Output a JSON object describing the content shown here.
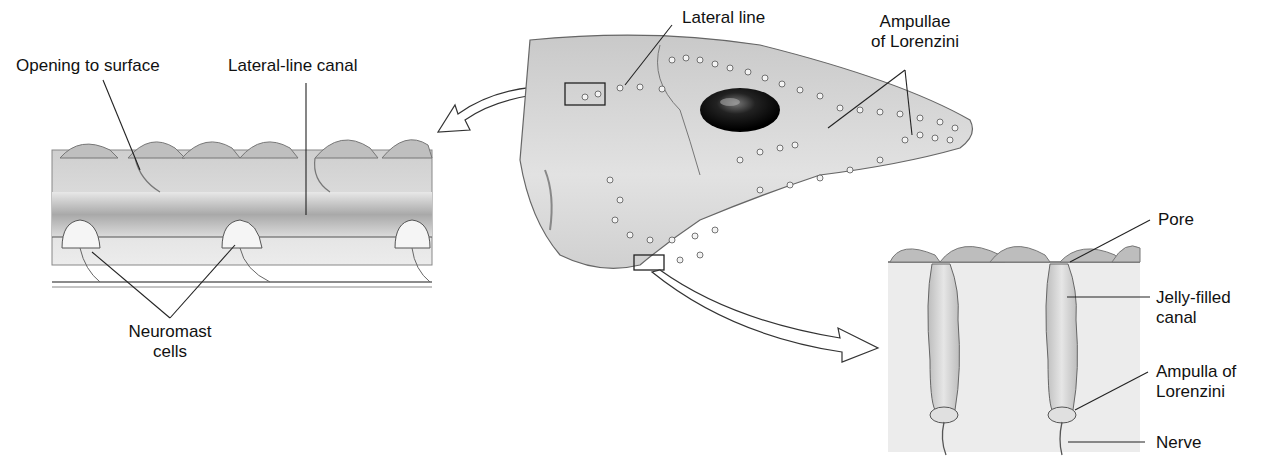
{
  "figure": {
    "panels": {
      "lateral_line_detail": {
        "labels": {
          "opening": "Opening to surface",
          "canal": "Lateral-line canal",
          "neuromast_line1": "Neuromast",
          "neuromast_line2": "cells"
        }
      },
      "shark_head": {
        "labels": {
          "lateral_line": "Lateral line",
          "ampullae_line1": "Ampullae",
          "ampullae_line2": "of Lorenzini"
        }
      },
      "ampulla_detail": {
        "labels": {
          "pore": "Pore",
          "jelly_line1": "Jelly-filled",
          "jelly_line2": "canal",
          "ampulla_line1": "Ampulla of",
          "ampulla_line2": "Lorenzini",
          "nerve": "Nerve"
        }
      }
    }
  }
}
